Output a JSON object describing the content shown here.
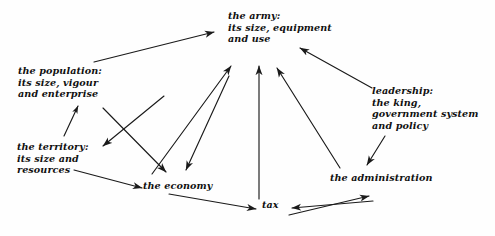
{
  "diagram": {
    "title": "",
    "stroke_color": "#1a1a1a",
    "background_color": "#fefefe",
    "nodes": {
      "army": "the army:\nits size, equipment\nand use",
      "population": "the population:\nits size, vigour\nand enterprise",
      "territory": "the territory:\nits size and\nresources",
      "leadership": "leadership:\nthe king,\ngovernment system\nand policy",
      "economy": "the economy",
      "tax": "tax",
      "administration": "the administration"
    },
    "edges": [
      {
        "from": "population",
        "to": "army",
        "arrow": "single"
      },
      {
        "from": "territory",
        "to": "population",
        "arrow": "single"
      },
      {
        "from": "army",
        "to": "territory",
        "arrow": "single"
      },
      {
        "from": "population",
        "to": "economy",
        "arrow": "single"
      },
      {
        "from": "economy",
        "to": "army",
        "arrow": "single"
      },
      {
        "from": "army",
        "to": "economy",
        "arrow": "single"
      },
      {
        "from": "territory",
        "to": "economy",
        "arrow": "single"
      },
      {
        "from": "economy",
        "to": "tax",
        "arrow": "single"
      },
      {
        "from": "tax",
        "to": "army",
        "arrow": "single"
      },
      {
        "from": "administration",
        "to": "army",
        "arrow": "single"
      },
      {
        "from": "leadership",
        "to": "army",
        "arrow": "single"
      },
      {
        "from": "leadership",
        "to": "administration",
        "arrow": "single"
      },
      {
        "from": "tax",
        "to": "administration",
        "arrow": "double"
      }
    ]
  }
}
